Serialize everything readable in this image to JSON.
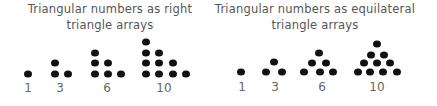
{
  "panels": [
    {
      "title_line1": "Triangular numbers as right",
      "title_line2": "triangle arrays",
      "groups": [
        {
          "label": "1"
        },
        {
          "label": "3"
        },
        {
          "label": "6"
        },
        {
          "label": "10"
        }
      ]
    },
    {
      "title_line1": "Triangular numbers as equilateral",
      "title_line2": "triangle arrays",
      "groups": [
        {
          "label": "1"
        },
        {
          "label": "3"
        },
        {
          "label": "6"
        },
        {
          "label": "10"
        }
      ]
    }
  ],
  "colors": {
    "dot": "#111111",
    "text": "#555555"
  }
}
